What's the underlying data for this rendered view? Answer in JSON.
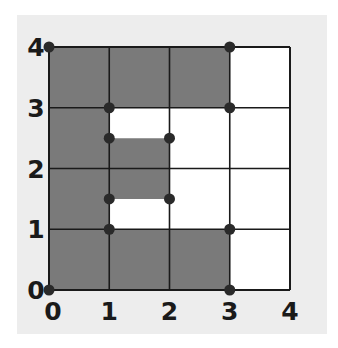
{
  "figure": {
    "type": "grid-region-diagram",
    "grid": {
      "x_min": 0,
      "x_max": 4,
      "y_min": 0,
      "y_max": 4,
      "step": 1
    },
    "x_tick_labels": [
      "0",
      "1",
      "2",
      "3",
      "4"
    ],
    "y_tick_labels": [
      "0",
      "1",
      "2",
      "3",
      "4"
    ],
    "colors": {
      "panel_background": "#ededed",
      "shaded_fill": "#7a7a7a",
      "unshaded_fill": "#ffffff",
      "grid_line": "#1a1a1a",
      "vertex_dot": "#2a2a2a"
    },
    "shaded_region_description": "Polygon with a rectangular cutout — outer boundary (0,0)-(3,0)-(3,1)-(1,1)-(1,3)-(3,3)-(3,4)-(0,4); plus inner shaded rectangle x 1..2, y 1.5..2.5",
    "shaded_polygons": [
      [
        [
          0,
          0
        ],
        [
          3,
          0
        ],
        [
          3,
          1
        ],
        [
          1,
          1
        ],
        [
          1,
          3
        ],
        [
          3,
          3
        ],
        [
          3,
          4
        ],
        [
          0,
          4
        ]
      ],
      [
        [
          1,
          1.5
        ],
        [
          2,
          1.5
        ],
        [
          2,
          2.5
        ],
        [
          1,
          2.5
        ]
      ]
    ],
    "vertex_points": [
      [
        0,
        4
      ],
      [
        3,
        4
      ],
      [
        1,
        3
      ],
      [
        3,
        3
      ],
      [
        1,
        2.5
      ],
      [
        2,
        2.5
      ],
      [
        1,
        1.5
      ],
      [
        2,
        1.5
      ],
      [
        1,
        1
      ],
      [
        3,
        1
      ],
      [
        0,
        0
      ],
      [
        3,
        0
      ]
    ]
  }
}
